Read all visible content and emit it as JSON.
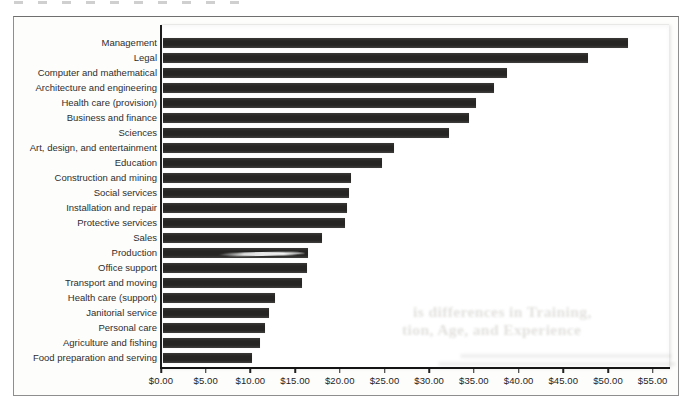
{
  "figure": {
    "ghost_text_line1": "is differences in Training,",
    "ghost_text_line2": "tion, Age, and Experience"
  },
  "chart_data": {
    "type": "bar",
    "orientation": "horizontal",
    "title": "",
    "xlabel": "",
    "ylabel": "",
    "xlim": [
      0,
      55
    ],
    "grid": false,
    "legend": false,
    "bar_color": "#2a2928",
    "x_ticks": [
      "$0.00",
      "$5.00",
      "$10.00",
      "$15.00",
      "$20.00",
      "$25.00",
      "$30.00",
      "$35.00",
      "$40.00",
      "$45.00",
      "$50.00",
      "$55.00"
    ],
    "categories": [
      "Management",
      "Legal",
      "Computer and mathematical",
      "Architecture and engineering",
      "Health care (provision)",
      "Business and finance",
      "Sciences",
      "Art, design, and entertainment",
      "Education",
      "Construction and mining",
      "Social services",
      "Installation and repair",
      "Protective services",
      "Sales",
      "Production",
      "Office support",
      "Transport and moving",
      "Health care (support)",
      "Janitorial service",
      "Personal care",
      "Agriculture and fishing",
      "Food preparation and serving"
    ],
    "values": [
      52.0,
      47.5,
      38.5,
      37.0,
      35.0,
      34.25,
      32.0,
      25.8,
      24.5,
      21.0,
      20.8,
      20.6,
      20.3,
      17.8,
      16.2,
      16.1,
      15.5,
      12.5,
      11.8,
      11.4,
      10.9,
      9.9
    ],
    "smear_artifact_category": "Production"
  }
}
